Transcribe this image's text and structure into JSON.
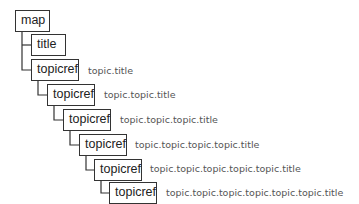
{
  "diagram": {
    "type": "tree",
    "nodes": [
      {
        "id": "map",
        "label": "map",
        "depth": 0,
        "annotation": ""
      },
      {
        "id": "title",
        "label": "title",
        "depth": 1,
        "annotation": ""
      },
      {
        "id": "topicref-1",
        "label": "topicref",
        "depth": 1,
        "annotation": "topic.title"
      },
      {
        "id": "topicref-2",
        "label": "topicref",
        "depth": 2,
        "annotation": "topic.topic.title"
      },
      {
        "id": "topicref-3",
        "label": "topicref",
        "depth": 3,
        "annotation": "topic.topic.topic.title"
      },
      {
        "id": "topicref-4",
        "label": "topicref",
        "depth": 4,
        "annotation": "topic.topic.topic.topic.title"
      },
      {
        "id": "topicref-5",
        "label": "topicref",
        "depth": 5,
        "annotation": "topic.topic.topic.topic.topic.title"
      },
      {
        "id": "topicref-6",
        "label": "topicref",
        "depth": 6,
        "annotation": "topic.topic.topic.topic.topic.topic.title"
      }
    ],
    "edges": [
      [
        "map",
        "title"
      ],
      [
        "map",
        "topicref-1"
      ],
      [
        "topicref-1",
        "topicref-2"
      ],
      [
        "topicref-2",
        "topicref-3"
      ],
      [
        "topicref-3",
        "topicref-4"
      ],
      [
        "topicref-4",
        "topicref-5"
      ],
      [
        "topicref-5",
        "topicref-6"
      ]
    ],
    "colors": {
      "box_border": "#333333",
      "box_text": "#222222",
      "annotation_text": "#555555",
      "connector": "#333333"
    }
  }
}
